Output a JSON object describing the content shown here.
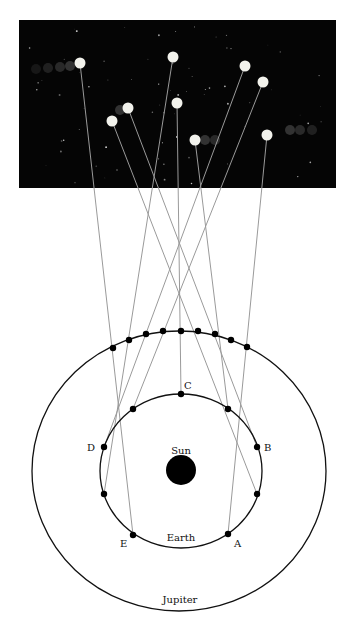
{
  "labels": {
    "sun": "Sun",
    "earth": "Earth",
    "jupiter": "Jupiter",
    "positions": [
      "A",
      "B",
      "C",
      "D",
      "E"
    ]
  },
  "colors": {
    "sky": "#050505",
    "planet": "#f2f2ec",
    "sight_line": "#9a9a9a",
    "orbit": "#111111",
    "sun": "#000000"
  },
  "sky_panel": {
    "x": 19,
    "y": 20,
    "width": 317,
    "height": 168
  },
  "sun": {
    "cx": 181,
    "cy": 470,
    "r": 15
  },
  "earth_orbit": {
    "cx": 181,
    "cy": 471,
    "rx": 81,
    "ry": 77
  },
  "jupiter_orbit": {
    "cx": 179,
    "cy": 471,
    "rx": 147,
    "ry": 140
  },
  "sight_lines": [
    {
      "earth": [
        228,
        534
      ],
      "jupiter": [
        247,
        347
      ],
      "sky": [
        267,
        135
      ],
      "label": "A"
    },
    {
      "earth": [
        257,
        447
      ],
      "jupiter": [
        215,
        334
      ],
      "sky": [
        128,
        108
      ],
      "label": "B"
    },
    {
      "earth": [
        257,
        494
      ],
      "jupiter": [
        231,
        340
      ],
      "sky": [
        112,
        121
      ],
      "label": ""
    },
    {
      "earth": [
        228,
        409
      ],
      "jupiter": [
        198,
        331
      ],
      "sky": [
        195,
        140
      ],
      "label": ""
    },
    {
      "earth": [
        181,
        394
      ],
      "jupiter": [
        181,
        331
      ],
      "sky": [
        177,
        103
      ],
      "label": "C"
    },
    {
      "earth": [
        133,
        409
      ],
      "jupiter": [
        163,
        331
      ],
      "sky": [
        263,
        82
      ],
      "label": ""
    },
    {
      "earth": [
        104,
        447
      ],
      "jupiter": [
        146,
        334
      ],
      "sky": [
        245,
        66
      ],
      "label": "D"
    },
    {
      "earth": [
        104,
        494
      ],
      "jupiter": [
        129,
        340
      ],
      "sky": [
        173,
        57
      ],
      "label": ""
    },
    {
      "earth": [
        133,
        535
      ],
      "jupiter": [
        113,
        348
      ],
      "sky": [
        80,
        63
      ],
      "label": "E"
    }
  ]
}
